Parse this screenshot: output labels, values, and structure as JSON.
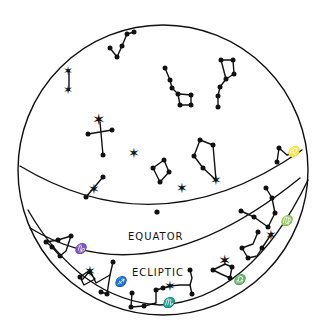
{
  "diagram": {
    "type": "celestial-sphere",
    "labels": {
      "equator": "EQUATOR",
      "ecliptic": "ECLIPTIC"
    },
    "zodiac_symbols": {
      "capricorn": "♑",
      "sagittarius": "♐",
      "scorpio": "♏",
      "libra": "♎",
      "virgo": "♍",
      "leo": "♌"
    },
    "colors": {
      "ink": "#111111",
      "background": "#ffffff"
    }
  }
}
